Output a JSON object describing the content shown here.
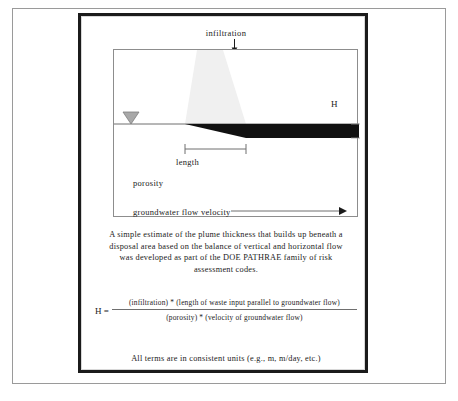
{
  "slide": {
    "diagram": {
      "infiltration_label": "infiltration",
      "length_label": "length",
      "porosity_label": "porosity",
      "groundwater_velocity_label": "groundwater flow velocity",
      "thickness_label": "H",
      "colors": {
        "plume_fill": "#f0f0f0",
        "saturated_plume": "#111111",
        "water_table_marker": "#a8a8a8",
        "box_outline": "#8d8d8d",
        "frame": "#1b1b1b"
      }
    },
    "description": [
      "A simple estimate of the plume thickness that builds up beneath a",
      "disposal area based on the balance of vertical and horizontal flow",
      "was developed as part of the DOE PATHRAE family of risk",
      "assessment codes."
    ],
    "equation": {
      "lhs": "H =",
      "numerator": "(infiltration) * (length of waste input parallel to groundwater flow)",
      "denominator": "(porosity) * (velocity of groundwater flow)"
    },
    "units_note": "All terms are in consistent units (e.g., m, m/day, etc.)"
  }
}
